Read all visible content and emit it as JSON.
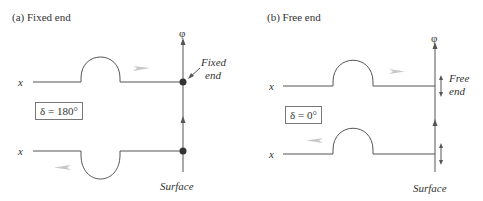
{
  "panels": [
    {
      "title": "(a) Fixed end",
      "axis_label": "φ",
      "x_label_top": "x",
      "x_label_bottom": "x",
      "phase": "δ = 180°",
      "end_label_line1": "Fixed",
      "end_label_line2": "end",
      "surface_label": "Surface"
    },
    {
      "title": "(b) Free end",
      "axis_label": "φ",
      "x_label_top": "x",
      "x_label_bottom": "x",
      "phase": "δ = 0°",
      "end_label_line1": "Free",
      "end_label_line2": "end",
      "surface_label": "Surface"
    }
  ],
  "colors": {
    "line": "#555555",
    "dot": "#333333",
    "motion_arrow": "#c8c8c8"
  }
}
